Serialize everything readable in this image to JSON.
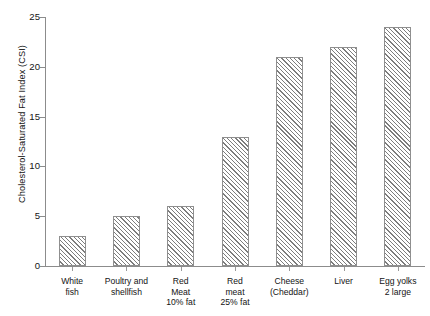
{
  "chart_data": {
    "type": "bar",
    "title": "",
    "xlabel": "",
    "ylabel": "Cholesterol-Saturated Fat Index (CSI)",
    "ylim": [
      0,
      25
    ],
    "yticks": [
      0,
      5,
      10,
      15,
      20,
      25
    ],
    "grid": false,
    "legend": null,
    "categories": [
      "White\nfish",
      "Poultry and\nshellfish",
      "Red\nMeat\n10% fat",
      "Red\nmeat\n25% fat",
      "Cheese\n(Cheddar)",
      "Liver",
      "Egg yolks\n2 large"
    ],
    "values": [
      3,
      5,
      6,
      13,
      21,
      22,
      24
    ],
    "bar_style": {
      "fill": "#ffffff",
      "hatch": "diagonal-45",
      "hatch_color": "#7d7d7d",
      "edge_color": "#8f8f8f"
    },
    "axis_color": "#8c8c8c",
    "text_color": "#141414",
    "background": "#ffffff"
  }
}
